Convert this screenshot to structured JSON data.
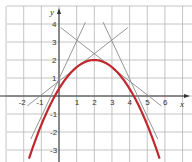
{
  "chart_data": {
    "type": "line",
    "title": "",
    "xlabel": "x",
    "ylabel": "y",
    "xlim": [
      -3.3,
      7.0
    ],
    "ylim": [
      -3.6,
      5.0
    ],
    "grid": true,
    "x_ticks": [
      -2,
      -1,
      1,
      2,
      3,
      4,
      5,
      6
    ],
    "y_ticks": [
      4,
      3,
      2,
      1,
      -1,
      -2,
      -3
    ],
    "series": [
      {
        "name": "parabola",
        "kind": "curve",
        "equation": "y = -0.4(x-2)^2 + 2",
        "vertex": [
          2,
          2
        ],
        "roots": [
          -0.24,
          4.24
        ],
        "domain": [
          -1.7,
          5.7
        ],
        "color": "#c0282d"
      },
      {
        "name": "tangent-1",
        "kind": "segment",
        "points": [
          [
            -1.6,
            -2.4
          ],
          [
            1.5,
            4.1
          ]
        ],
        "color": "#8a8a8a"
      },
      {
        "name": "tangent-2",
        "kind": "segment",
        "points": [
          [
            -1.8,
            -0.55
          ],
          [
            3.9,
            3.8
          ]
        ],
        "color": "#8a8a8a"
      },
      {
        "name": "tangent-3",
        "kind": "segment",
        "points": [
          [
            0.1,
            3.8
          ],
          [
            5.8,
            -0.55
          ]
        ],
        "color": "#8a8a8a"
      },
      {
        "name": "tangent-4",
        "kind": "segment",
        "points": [
          [
            2.5,
            4.1
          ],
          [
            5.6,
            -2.4
          ]
        ],
        "color": "#8a8a8a"
      }
    ]
  },
  "colors": {
    "grid": "#b5b5b5",
    "axis": "#333333",
    "curve": "#c0282d",
    "tangent": "#8a8a8a"
  }
}
